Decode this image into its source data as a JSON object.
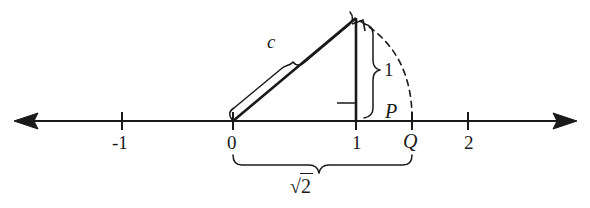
{
  "figure": {
    "line_color": "#1a1a1a",
    "background": "#ffffff",
    "axis": {
      "name": "number-line",
      "left_arrow": "left-arrowhead",
      "right_arrow": "right-arrowhead",
      "ticks": [
        {
          "label": "-1",
          "x": 122
        },
        {
          "label": "0",
          "x": 233
        },
        {
          "label": "1",
          "x": 356
        },
        {
          "label": "2",
          "x": 468
        }
      ]
    },
    "points": [
      {
        "label": "P",
        "name": "point-p"
      },
      {
        "label": "Q",
        "name": "point-q"
      }
    ],
    "segments": [
      {
        "label": "c",
        "name": "hypotenuse-label"
      },
      {
        "label": "1",
        "name": "vertical-leg-label"
      }
    ],
    "measure": {
      "radical_symbol": "√",
      "radicand": "2",
      "full": "√2"
    },
    "markers": {
      "right_angle": "right-angle-marker",
      "arc": "compass-arc"
    }
  }
}
